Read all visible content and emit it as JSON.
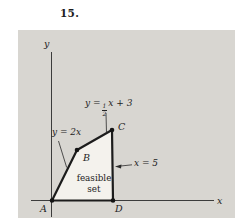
{
  "problem_number": "15.",
  "figure": {
    "axes": {
      "x_label": "x",
      "y_label": "y"
    },
    "equations": {
      "line_ab": "y = 2x",
      "line_bc_prefix": "y =",
      "line_bc_frac_num": "1",
      "line_bc_frac_den": "2",
      "line_bc_suffix": "x + 3",
      "line_cd": "x = 5"
    },
    "region_label_line1": "feasible",
    "region_label_line2": "set",
    "vertex_labels": {
      "a": "A",
      "b": "B",
      "c": "C",
      "d": "D"
    },
    "colors": {
      "figure_background": "#d8d6d1",
      "region_fill": "#f4f2ed",
      "line_color": "#1c1c1c"
    }
  }
}
